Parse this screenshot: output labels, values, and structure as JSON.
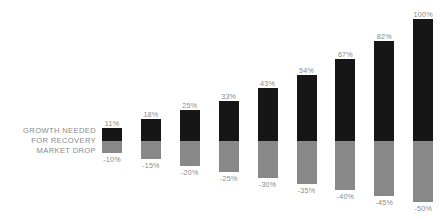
{
  "caption": {
    "lines": [
      "Growth Needed",
      "For Recovery",
      "Market Drop"
    ]
  },
  "colors": {
    "background": "#ffffff",
    "growth_bar": "#161616",
    "drop_bar": "#888888",
    "label_text": "#8a8a8a"
  },
  "chart_data": {
    "type": "bar",
    "subtype": "diverging-stacked-column",
    "title": "",
    "subtitle": "",
    "xlabel": "",
    "ylabel": "",
    "grid": false,
    "legend_position": "left-inline",
    "baseline": 0,
    "ylim": [
      -55,
      110
    ],
    "categories": [
      "-10%",
      "-15%",
      "-20%",
      "-25%",
      "-30%",
      "-35%",
      "-40%",
      "-45%",
      "-50%"
    ],
    "series": [
      {
        "name": "Growth Needed For Recovery",
        "color": "#161616",
        "direction": "up",
        "values": [
          11,
          18,
          25,
          33,
          43,
          54,
          67,
          82,
          100
        ],
        "labels": [
          "11%",
          "18%",
          "25%",
          "33%",
          "43%",
          "54%",
          "67%",
          "82%",
          "100%"
        ]
      },
      {
        "name": "Market Drop",
        "color": "#888888",
        "direction": "down",
        "values": [
          -10,
          -15,
          -20,
          -25,
          -30,
          -35,
          -40,
          -45,
          -50
        ],
        "labels": [
          "-10%",
          "-15%",
          "-20%",
          "-25%",
          "-30%",
          "-35%",
          "-40%",
          "-45%",
          "-50%"
        ]
      }
    ]
  },
  "layout": {
    "baseline_y": 141,
    "first_bar_x": 102,
    "bar_pitch": 38.9,
    "bar_width": 20,
    "px_per_pct": 1.225,
    "top_label_gap": 9,
    "bottom_label_gap": 9
  }
}
